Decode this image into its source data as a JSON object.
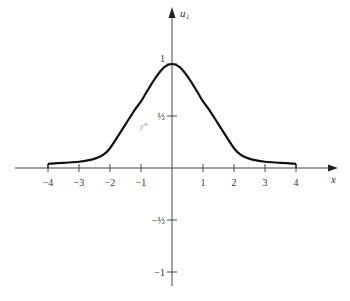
{
  "chart_data": {
    "type": "line",
    "title": "",
    "xlabel": "x",
    "ylabel": "u₁",
    "xlim": [
      -4.5,
      5.2
    ],
    "ylim": [
      -1.15,
      1.55
    ],
    "grid": false,
    "legend": null,
    "x_ticks": [
      -4,
      -3,
      -2,
      -1,
      1,
      2,
      3,
      4
    ],
    "x_tick_labels": [
      "−4",
      "−3",
      "−2",
      "−1",
      "1",
      "2",
      "3",
      "4"
    ],
    "y_ticks": [
      1,
      0.5,
      -0.5,
      -1
    ],
    "y_tick_labels": [
      "1",
      "½",
      "−½",
      "−1"
    ],
    "annotations": [
      {
        "text": "y*",
        "x": -0.95,
        "y": 0.38
      }
    ],
    "series": [
      {
        "name": "u1(x)",
        "x": [
          -4,
          -3.5,
          -3,
          -2.6,
          -2.4,
          -2.2,
          -2,
          -1.8,
          -1.5,
          -1.2,
          -1,
          -0.8,
          -0.5,
          -0.25,
          0,
          0.25,
          0.5,
          0.8,
          1,
          1.2,
          1.5,
          1.8,
          2,
          2.2,
          2.4,
          2.6,
          3,
          3.5,
          4
        ],
        "y": [
          0.04,
          0.05,
          0.06,
          0.08,
          0.1,
          0.13,
          0.19,
          0.28,
          0.42,
          0.56,
          0.64,
          0.74,
          0.88,
          0.97,
          1.0,
          0.97,
          0.88,
          0.74,
          0.64,
          0.56,
          0.42,
          0.28,
          0.19,
          0.13,
          0.1,
          0.08,
          0.06,
          0.05,
          0.04
        ]
      }
    ]
  }
}
